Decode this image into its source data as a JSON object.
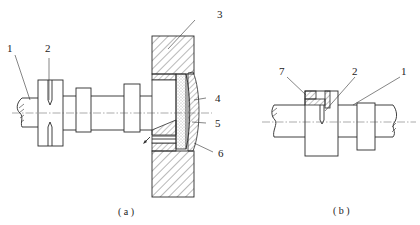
{
  "figure": {
    "panel_a": {
      "caption": "( a )",
      "callouts": [
        {
          "id": "1",
          "text": "1"
        },
        {
          "id": "2",
          "text": "2"
        },
        {
          "id": "3",
          "text": "3"
        },
        {
          "id": "4",
          "text": "4"
        },
        {
          "id": "5",
          "text": "5"
        },
        {
          "id": "6",
          "text": "6"
        }
      ]
    },
    "panel_b": {
      "caption": "( b )",
      "callouts": [
        {
          "id": "7",
          "text": "7"
        },
        {
          "id": "2",
          "text": "2"
        },
        {
          "id": "1",
          "text": "1"
        }
      ]
    }
  }
}
